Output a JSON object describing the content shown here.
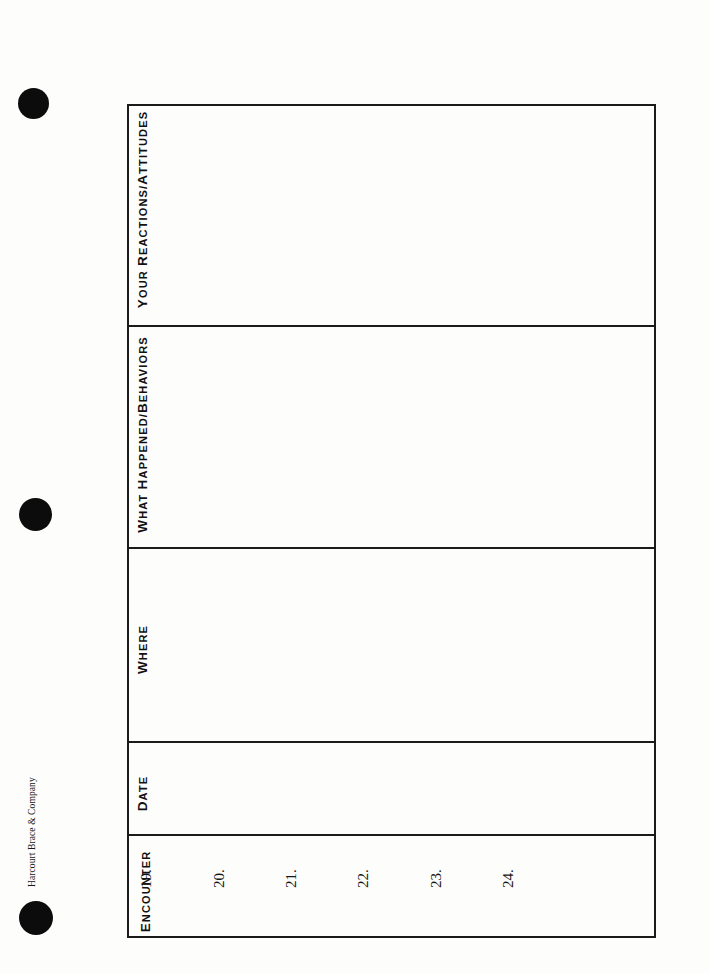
{
  "document": {
    "kind": "worksheet",
    "orientation": "rotated-90-ccw",
    "credit": "Harcourt Brace & Company",
    "background_color": "#fdfdfc",
    "rule_color": "#1b1b1b",
    "hole_color": "#0c0c0c"
  },
  "holes": [
    {
      "name": "binder-hole-top"
    },
    {
      "name": "binder-hole-middle"
    },
    {
      "name": "binder-hole-bottom"
    }
  ],
  "table": {
    "columns": [
      {
        "id": "encounter",
        "label": "Encounter",
        "first_letter": "E",
        "rest": "NCOUNTER"
      },
      {
        "id": "date",
        "label": "Date",
        "first_letter": "D",
        "rest": "ATE"
      },
      {
        "id": "where",
        "label": "Where",
        "first_letter": "W",
        "rest": "HERE"
      },
      {
        "id": "what-happened-behaviors",
        "label": "What Happened/Behaviors",
        "first_letter": "W",
        "rest": "HAT ",
        "first_letter_2": "H",
        "rest_2": "APPENED/",
        "first_letter_3": "B",
        "rest_3": "EHAVIORS"
      },
      {
        "id": "your-reactions-attitudes",
        "label": "Your Reactions/Attitudes",
        "first_letter": "Y",
        "rest": "OUR ",
        "first_letter_2": "R",
        "rest_2": "EACTIONS/",
        "first_letter_3": "A",
        "rest_3": "TTITUDES"
      }
    ],
    "rows": [
      {
        "number": "19."
      },
      {
        "number": "20."
      },
      {
        "number": "21."
      },
      {
        "number": "22."
      },
      {
        "number": "23."
      },
      {
        "number": "24."
      }
    ]
  }
}
